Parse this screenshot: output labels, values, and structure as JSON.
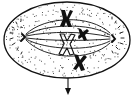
{
  "figure": {
    "subject": "cell-division-metaphase",
    "colors": {
      "background": "#ffffff",
      "ink": "#111111",
      "stipple": "#333333"
    },
    "cell": {
      "cx": 67,
      "cy": 40,
      "rx": 63,
      "ry": 38
    },
    "poles": [
      {
        "name": "left-pole",
        "x": 23,
        "y": 37
      },
      {
        "name": "right-pole",
        "x": 113,
        "y": 38
      }
    ],
    "chromosomes": [
      {
        "name": "chromosome-top",
        "x": 66,
        "y": 19,
        "style": "solid"
      },
      {
        "name": "chromosome-right",
        "x": 82,
        "y": 33,
        "style": "solid-small"
      },
      {
        "name": "chromosome-center",
        "x": 66,
        "y": 45,
        "style": "hollow"
      },
      {
        "name": "chromosome-bottom",
        "x": 80,
        "y": 62,
        "style": "solid"
      }
    ],
    "arrow": {
      "x": 68,
      "y1": 78,
      "y2": 94,
      "direction": "down"
    },
    "fiber_count": 6
  }
}
